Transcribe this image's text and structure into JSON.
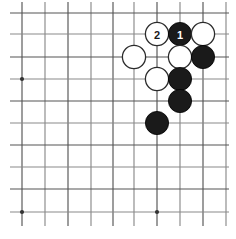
{
  "figure": {
    "kind": "go-board-diagram",
    "background_color": "#ffffff",
    "board": {
      "grid_line_color": "#555555",
      "grid_line_color_light": "#8a8a8a",
      "grid_line_width": 1.15,
      "columns": 10,
      "rows": 10,
      "x_positions": [
        22,
        45,
        68,
        91,
        113,
        134,
        157,
        180,
        203,
        226
      ],
      "y_positions": [
        13,
        34,
        57,
        79,
        101,
        123,
        145,
        167,
        189,
        212
      ],
      "star_points": [
        {
          "col": 0,
          "row": 3
        },
        {
          "col": 0,
          "row": 9
        },
        {
          "col": 6,
          "row": 9
        }
      ],
      "star_point_radius": 2.1,
      "star_point_color": "#333333"
    },
    "stones": {
      "radius": 11.6,
      "black_fill": "#1a1a1a",
      "black_stroke": "#000000",
      "white_fill": "#ffffff",
      "white_stroke": "#2b2b2b",
      "white_stroke_width": 1.3,
      "black_label_color": "#ffffff",
      "white_label_color": "#1a1a1a",
      "label_font_size": 11,
      "list": [
        {
          "col": 6,
          "row": 1,
          "color": "white",
          "label": "2",
          "name": "stone-white-2"
        },
        {
          "col": 7,
          "row": 1,
          "color": "black",
          "label": "1",
          "name": "stone-black-1"
        },
        {
          "col": 8,
          "row": 1,
          "color": "white",
          "label": "",
          "name": "stone-white-r1c8"
        },
        {
          "col": 5,
          "row": 2,
          "color": "white",
          "label": "",
          "name": "stone-white-r2c5"
        },
        {
          "col": 7,
          "row": 2,
          "color": "white",
          "label": "",
          "name": "stone-white-r2c7"
        },
        {
          "col": 8,
          "row": 2,
          "color": "black",
          "label": "",
          "name": "stone-black-r2c8"
        },
        {
          "col": 6,
          "row": 3,
          "color": "white",
          "label": "",
          "name": "stone-white-r3c6"
        },
        {
          "col": 7,
          "row": 3,
          "color": "black",
          "label": "",
          "name": "stone-black-r3c7"
        },
        {
          "col": 7,
          "row": 4,
          "color": "black",
          "label": "",
          "name": "stone-black-r4c7"
        },
        {
          "col": 6,
          "row": 5,
          "color": "black",
          "label": "",
          "name": "stone-black-r5c6"
        }
      ]
    }
  }
}
